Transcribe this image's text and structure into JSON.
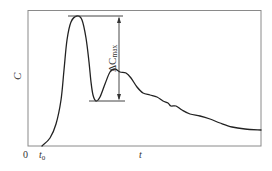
{
  "chart_data": {
    "type": "line",
    "title": "",
    "xlabel": "t",
    "ylabel": "C",
    "x_ticks": [
      "0",
      "t0"
    ],
    "origin_label": "0",
    "t0_label": "t",
    "t0_sub": "0",
    "annotation": {
      "label_main": "ΔC",
      "label_sub": "max",
      "description": "Double-headed arrow between primary peak and following trough"
    },
    "grid": false,
    "legend": null,
    "series": [
      {
        "name": "C(t)",
        "description": "Concentration vs time: rapid rise after t0 to a sharp peak, dip, secondary peak, then slow decay",
        "points_px": [
          [
            42,
            146
          ],
          [
            50,
            138
          ],
          [
            56,
            124
          ],
          [
            61,
            100
          ],
          [
            64,
            70
          ],
          [
            67,
            40
          ],
          [
            71,
            22
          ],
          [
            77,
            16
          ],
          [
            82,
            20
          ],
          [
            86,
            38
          ],
          [
            89,
            62
          ],
          [
            91,
            82
          ],
          [
            93,
            95
          ],
          [
            96,
            101
          ],
          [
            100,
            97
          ],
          [
            105,
            84
          ],
          [
            110,
            72
          ],
          [
            115,
            69
          ],
          [
            120,
            72
          ],
          [
            126,
            73
          ],
          [
            131,
            78
          ],
          [
            137,
            87
          ],
          [
            143,
            93
          ],
          [
            150,
            95
          ],
          [
            157,
            97
          ],
          [
            163,
            101
          ],
          [
            168,
            103
          ],
          [
            171,
            106
          ],
          [
            176,
            106
          ],
          [
            182,
            110
          ],
          [
            190,
            114
          ],
          [
            200,
            116
          ],
          [
            210,
            119
          ],
          [
            220,
            123
          ],
          [
            232,
            127
          ],
          [
            245,
            129
          ],
          [
            261,
            130
          ]
        ]
      }
    ],
    "colors": {
      "curve": "#222222",
      "frame": "#888888",
      "text": "#333333"
    }
  }
}
